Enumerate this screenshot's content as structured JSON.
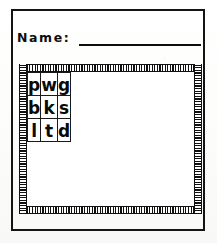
{
  "worksheet": {
    "name_field": {
      "label": "Name:",
      "value": "",
      "placeholder": ""
    },
    "grid": {
      "columns": 3,
      "rows": [
        {
          "cells": [
            {
              "letter": "p"
            },
            {
              "letter": "w"
            },
            {
              "letter": "g"
            }
          ]
        },
        {
          "cells": [
            {
              "letter": "b"
            },
            {
              "letter": "k"
            },
            {
              "letter": "s"
            }
          ]
        },
        {
          "cells": [
            {
              "letter": "l"
            },
            {
              "letter": "t"
            },
            {
              "letter": "d"
            }
          ]
        }
      ]
    },
    "colors": {
      "ink": "#0f0f0f",
      "paper": "#fdfdfb",
      "rule": "#1a1a1a"
    }
  }
}
